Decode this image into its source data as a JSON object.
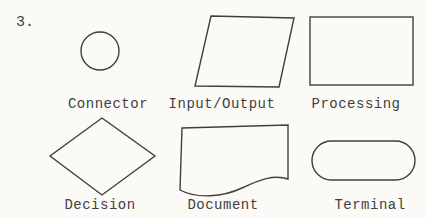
{
  "figure": {
    "number_label": "3.",
    "items": [
      {
        "label": "Connector",
        "shape": "circle"
      },
      {
        "label": "Input/Output",
        "shape": "parallelogram"
      },
      {
        "label": "Processing",
        "shape": "rectangle"
      },
      {
        "label": "Decision",
        "shape": "diamond"
      },
      {
        "label": "Document",
        "shape": "document-wavy-rectangle"
      },
      {
        "label": "Terminal",
        "shape": "rounded-stadium"
      }
    ],
    "colors": {
      "ink": "#3f3f3f",
      "paper": "#fbfaf7"
    }
  }
}
